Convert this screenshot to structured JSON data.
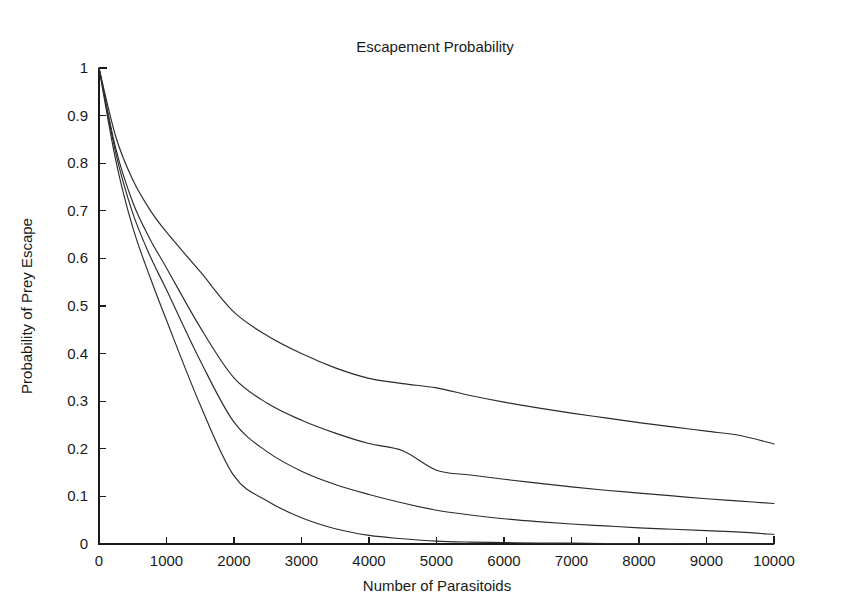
{
  "figure": {
    "background": "#ffffff",
    "width": 847,
    "height": 615
  },
  "chart_data": {
    "type": "line",
    "title": "Escapement Probability",
    "xlabel": "Number of Parasitoids",
    "ylabel": "Probability of Prey Escape",
    "xlim": [
      0,
      10000
    ],
    "ylim": [
      0,
      1
    ],
    "grid": false,
    "legend_position": "none",
    "line_color": "#2b2b2b",
    "xticks": [
      0,
      1000,
      2000,
      3000,
      4000,
      5000,
      6000,
      7000,
      8000,
      9000,
      10000
    ],
    "xtick_labels": [
      "0",
      "1000",
      "2000",
      "3000",
      "4000",
      "5000",
      "6000",
      "7000",
      "8000",
      "9000",
      "10000"
    ],
    "yticks": [
      0,
      0.1,
      0.2,
      0.3,
      0.4,
      0.5,
      0.6,
      0.7,
      0.8,
      0.9,
      1
    ],
    "ytick_labels": [
      "0",
      "0.1",
      "0.2",
      "0.3",
      "0.4",
      "0.5",
      "0.6",
      "0.7",
      "0.8",
      "0.9",
      "1"
    ],
    "x": [
      0,
      250,
      500,
      750,
      1000,
      1500,
      2000,
      2500,
      3000,
      3500,
      4000,
      4500,
      5000,
      5500,
      6000,
      6500,
      7000,
      7500,
      8000,
      8500,
      9000,
      9500,
      10000
    ],
    "series": [
      {
        "name": "curve-1-upper",
        "values": [
          1.0,
          0.855,
          0.765,
          0.703,
          0.655,
          0.572,
          0.487,
          0.437,
          0.4,
          0.37,
          0.348,
          0.337,
          0.328,
          0.312,
          0.298,
          0.286,
          0.275,
          0.265,
          0.255,
          0.246,
          0.237,
          0.228,
          0.21
        ]
      },
      {
        "name": "curve-2",
        "values": [
          1.0,
          0.83,
          0.718,
          0.642,
          0.58,
          0.455,
          0.349,
          0.295,
          0.26,
          0.233,
          0.211,
          0.196,
          0.155,
          0.145,
          0.136,
          0.128,
          0.12,
          0.113,
          0.107,
          0.101,
          0.095,
          0.09,
          0.085
        ]
      },
      {
        "name": "curve-3",
        "values": [
          1.0,
          0.82,
          0.695,
          0.607,
          0.534,
          0.385,
          0.256,
          0.193,
          0.153,
          0.125,
          0.104,
          0.086,
          0.071,
          0.061,
          0.053,
          0.047,
          0.042,
          0.038,
          0.034,
          0.031,
          0.028,
          0.025,
          0.02
        ]
      },
      {
        "name": "curve-4-lower",
        "values": [
          1.0,
          0.805,
          0.665,
          0.563,
          0.47,
          0.292,
          0.143,
          0.09,
          0.055,
          0.032,
          0.018,
          0.011,
          0.006,
          0.004,
          0.003,
          0.002,
          0.002,
          0.001,
          0.001,
          0.001,
          0.0,
          0.0,
          0.0
        ]
      }
    ]
  }
}
